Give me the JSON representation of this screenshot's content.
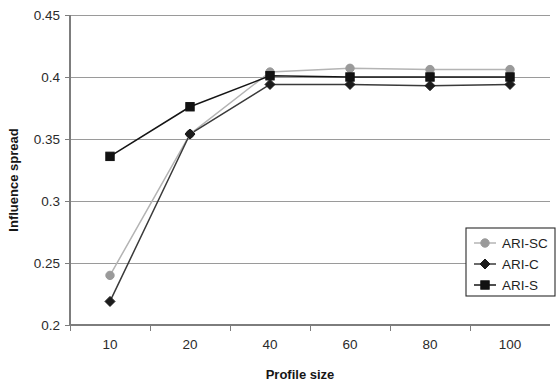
{
  "chart_data": {
    "type": "line",
    "title": "",
    "xlabel": "Profile size",
    "ylabel": "Influence spread",
    "categories": [
      "10",
      "20",
      "40",
      "60",
      "80",
      "100"
    ],
    "x": [
      10,
      20,
      40,
      60,
      80,
      100
    ],
    "ylim": [
      0.2,
      0.45
    ],
    "yticks": [
      "0.2",
      "0.25",
      "0.3",
      "0.35",
      "0.4",
      "0.45"
    ],
    "ytick_values": [
      0.2,
      0.25,
      0.3,
      0.35,
      0.4,
      0.45
    ],
    "grid": true,
    "legend_position": "bottom-right",
    "series": [
      {
        "name": "ARI-SC",
        "marker": "circle",
        "color": "#9a9a9a",
        "line_color": "#b4b4b4",
        "values": [
          0.24,
          0.354,
          0.404,
          0.407,
          0.406,
          0.406
        ]
      },
      {
        "name": "ARI-C",
        "marker": "diamond",
        "color": "#1c1c1c",
        "line_color": "#3a3a3a",
        "values": [
          0.219,
          0.354,
          0.394,
          0.394,
          0.393,
          0.394
        ]
      },
      {
        "name": "ARI-S",
        "marker": "square",
        "color": "#121212",
        "line_color": "#151515",
        "values": [
          0.336,
          0.376,
          0.401,
          0.4,
          0.4,
          0.4
        ]
      }
    ]
  },
  "legend": {
    "entries": [
      {
        "label": "ARI-SC"
      },
      {
        "label": "ARI-C"
      },
      {
        "label": "ARI-S"
      }
    ]
  },
  "axes": {
    "x_label": "Profile size",
    "y_label": "Influence spread",
    "x_ticks": [
      "10",
      "20",
      "40",
      "60",
      "80",
      "100"
    ],
    "y_ticks": [
      "0.45",
      "0.4",
      "0.35",
      "0.3",
      "0.25",
      "0.2"
    ]
  },
  "colors": {
    "grid": "#9a9a9a",
    "axis": "#7d7d7d",
    "series_sc": "#9a9a9a",
    "series_c": "#1c1c1c",
    "series_s": "#121212",
    "background": "#ffffff"
  }
}
